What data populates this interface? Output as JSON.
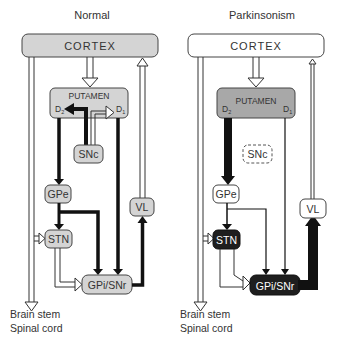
{
  "panels": [
    {
      "id": "normal",
      "title": "Normal",
      "cortex": "CORTEX",
      "putamen": "PUTAMEN",
      "d2": "D",
      "d2_sub": "2",
      "d1": "D",
      "d1_sub": "1",
      "snc": "SNc",
      "gpe": "GPe",
      "stn": "STN",
      "gpi": "GPi/SNr",
      "vl": "VL",
      "footer": [
        "Brain stem",
        "Spinal cord"
      ]
    },
    {
      "id": "parkinsonism",
      "title": "Parkinsonism",
      "cortex": "CORTEX",
      "putamen": "PUTAMEN",
      "d2": "D",
      "d2_sub": "2",
      "d1": "D",
      "d1_sub": "1",
      "snc": "SNc",
      "gpe": "GPe",
      "stn": "STN",
      "gpi": "GPi/SNr",
      "vl": "VL",
      "footer": [
        "Brain stem",
        "Spinal cord"
      ]
    }
  ],
  "colors": {
    "box_gray": "#d4d4d4",
    "box_dark": "#1e1e1e",
    "box_white": "#ffffff",
    "line": "#333333",
    "stroke_dark": "#111111"
  }
}
